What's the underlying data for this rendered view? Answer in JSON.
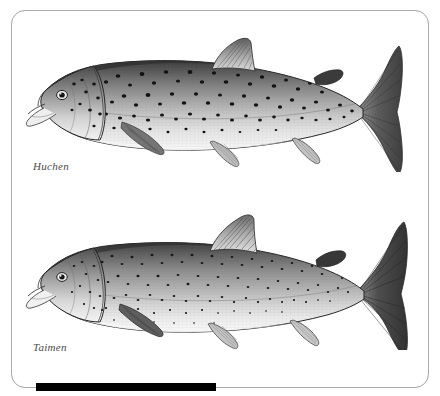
{
  "plate": {
    "kind": "field-guide-illustration-plate",
    "background_color": "#ffffff",
    "frame_color": "#b9b9b9",
    "bar_color": "#000000",
    "width": 440,
    "height": 396
  },
  "figures": [
    {
      "id": "huchen",
      "caption": "Huchen",
      "subject": "salmonid fish lateral view illustration",
      "orientation": "head-left",
      "style": "grayscale stipple and line engraving",
      "body_tone_dark": "#4b4b4b",
      "body_tone_mid": "#9a9a9a",
      "body_tone_light": "#e8e8e8",
      "spot_color": "#141414",
      "spot_count": 150,
      "spot_size": "large",
      "fins": [
        "dorsal",
        "adipose",
        "pectoral",
        "pelvic",
        "anal",
        "caudal"
      ],
      "caudal_shape": "forked"
    },
    {
      "id": "taimen",
      "caption": "Taimen",
      "subject": "salmonid fish lateral view illustration",
      "orientation": "head-left",
      "style": "grayscale stipple and line engraving",
      "body_tone_dark": "#5a5a5a",
      "body_tone_mid": "#a5a5a5",
      "body_tone_light": "#ededed",
      "spot_color": "#1a1a1a",
      "spot_count": 220,
      "spot_size": "small",
      "fins": [
        "dorsal",
        "adipose",
        "pectoral",
        "pelvic",
        "anal",
        "caudal"
      ],
      "caudal_shape": "broad-forked"
    }
  ],
  "bottom_bar": {
    "label": "black scale bar",
    "x": 36,
    "y": 383,
    "width": 180,
    "height": 8
  }
}
